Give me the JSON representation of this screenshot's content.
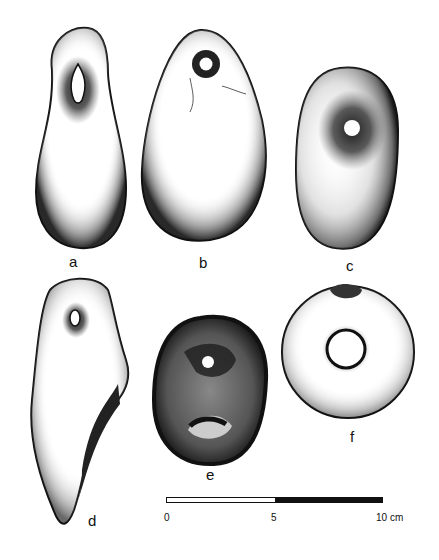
{
  "figure": {
    "objects": [
      {
        "id": "a",
        "label": "a"
      },
      {
        "id": "b",
        "label": "b"
      },
      {
        "id": "c",
        "label": "c"
      },
      {
        "id": "d",
        "label": "d"
      },
      {
        "id": "e",
        "label": "e"
      },
      {
        "id": "f",
        "label": "f"
      }
    ],
    "scale_bar": {
      "ticks": [
        "0",
        "5",
        "10"
      ],
      "unit": "cm",
      "segments": [
        "white",
        "black"
      ]
    }
  },
  "colors": {
    "ink": "#111111",
    "paper": "#ffffff"
  }
}
